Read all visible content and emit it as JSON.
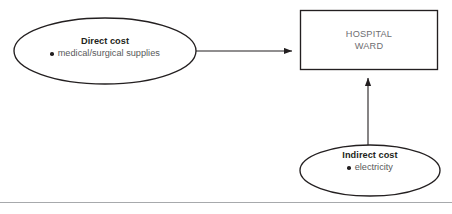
{
  "diagram": {
    "background_color": "#ffffff",
    "stroke_color": "#231f20",
    "nodes": {
      "direct_cost": {
        "shape": "ellipse",
        "title": "Direct cost",
        "bullets": [
          "medical/surgical supplies"
        ]
      },
      "indirect_cost": {
        "shape": "ellipse",
        "title": "Indirect cost",
        "bullets": [
          "electricity"
        ]
      },
      "hospital_ward": {
        "shape": "rectangle",
        "line1": "HOSPITAL",
        "line2": "WARD"
      }
    },
    "arrows": [
      {
        "name": "direct-cost-to-ward",
        "from": "direct_cost",
        "to": "hospital_ward",
        "direction": "right"
      },
      {
        "name": "indirect-cost-to-ward",
        "from": "indirect_cost",
        "to": "hospital_ward",
        "direction": "up"
      }
    ],
    "footer_rule": true
  }
}
